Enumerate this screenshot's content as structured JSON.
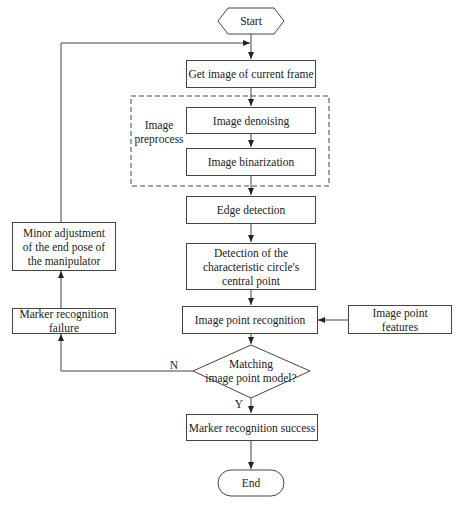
{
  "flowchart": {
    "start": "Start",
    "end": "End",
    "steps": {
      "get_image": "Get image of current frame",
      "denoising": "Image denoising",
      "binarization": "Image binarization",
      "edge_detection": "Edge detection",
      "circle_center_line1": "Detection of the",
      "circle_center_line2": "characteristic circle's",
      "circle_center_line3": "central point",
      "point_recognition": "Image point recognition",
      "point_features_line1": "Image point",
      "point_features_line2": "features",
      "success": "Marker recognition success",
      "failure_line1": "Marker recognition",
      "failure_line2": "failure",
      "adjust_line1": "Minor adjustment",
      "adjust_line2": "of the end pose of",
      "adjust_line3": "the manipulator"
    },
    "group": {
      "label_line1": "Image",
      "label_line2": "preprocess"
    },
    "decision": {
      "line1": "Matching",
      "line2": "image point model?",
      "yes": "Y",
      "no": "N"
    }
  }
}
